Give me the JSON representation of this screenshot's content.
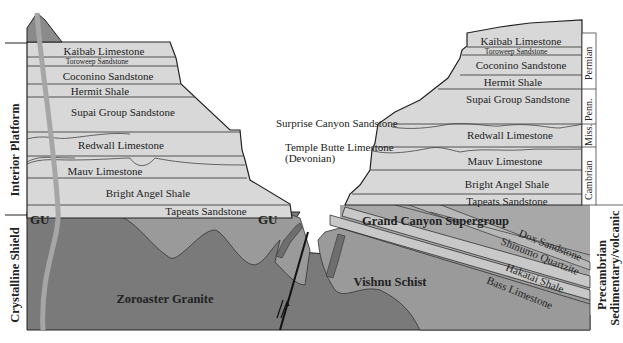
{
  "diagram": {
    "colors": {
      "background": "#ffffff",
      "sedimentary_layers": "#d8d8d8",
      "supergroup": "#a8a8a8",
      "supergroup_bands": "#c8c8c8",
      "crystalline": "#7a7a7a",
      "vishnu": "#9a9a9a",
      "dike": "#6e6e6e",
      "intrusion_vein": "#a0a0a0",
      "outline": "#222222"
    },
    "side_labels": {
      "left_upper": "Interior Platform",
      "left_lower": "Crystalline Shield",
      "right_lower_line1": "Precambrian",
      "right_lower_line2": "Sedimentary/volcanic"
    },
    "periods": [
      {
        "label": "Permian"
      },
      {
        "label": "Penn."
      },
      {
        "label": "Miss."
      },
      {
        "label": "Cambrian"
      }
    ],
    "left_wall_layers": [
      {
        "label": "Kaibab Limestone"
      },
      {
        "label": "Toroweep Sandstone"
      },
      {
        "label": "Coconino Sandstone"
      },
      {
        "label": "Hermit Shale"
      },
      {
        "label": "Supai Group Sandstone"
      },
      {
        "label": "Redwall Limestone"
      },
      {
        "label": "Mauv Limestone"
      },
      {
        "label": "Bright Angel Shale"
      },
      {
        "label": "Tapeats Sandstone"
      }
    ],
    "right_wall_layers": [
      {
        "label": "Kaibab Limestone"
      },
      {
        "label": "Toroweep Sandstone"
      },
      {
        "label": "Coconino Sandstone"
      },
      {
        "label": "Hermit Shale"
      },
      {
        "label": "Supai Group Sandstone"
      },
      {
        "label": "Redwall Limestone"
      },
      {
        "label": "Mauv Limestone"
      },
      {
        "label": "Bright Angel Shale"
      },
      {
        "label": "Tapeats Sandstone"
      }
    ],
    "callouts": {
      "surprise_canyon": "Surprise Canyon Sandstone",
      "temple_butte_line1": "Temple Butte Limestone",
      "temple_butte_line2": "(Devonian)"
    },
    "supergroup": {
      "title": "Grand Canyon Supergroup",
      "units": [
        {
          "label": "Dox Sandstone"
        },
        {
          "label": "Shinumo Quartzite"
        },
        {
          "label": "Hakatai Shale"
        },
        {
          "label": "Bass Limestone"
        }
      ]
    },
    "basement": {
      "zoroaster": "Zoroaster Granite",
      "vishnu": "Vishnu Schist"
    },
    "unconformity_labels": {
      "left": "GU",
      "center": "GU"
    },
    "fault_symbol": "fault-offset-arrows"
  }
}
